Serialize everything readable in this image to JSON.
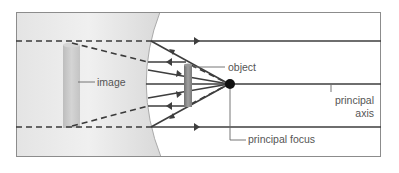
{
  "diagram": {
    "labels": {
      "image": "image",
      "object": "object",
      "principal_focus": "principal focus",
      "principal_axis_line1": "principal",
      "principal_axis_line2": "axis"
    },
    "colors": {
      "frame": "#888888",
      "ray": "#444444",
      "lens_fill": "#dedede",
      "image_fill": "#c8c8c8",
      "object_fill": "#8a8a8a",
      "focus": "#111111",
      "label_text": "#555555"
    },
    "elements": [
      "concave lens region",
      "parallel incident rays",
      "diverging refracted rays",
      "virtual image (dashed extensions)",
      "object",
      "principal focus",
      "principal axis"
    ]
  }
}
